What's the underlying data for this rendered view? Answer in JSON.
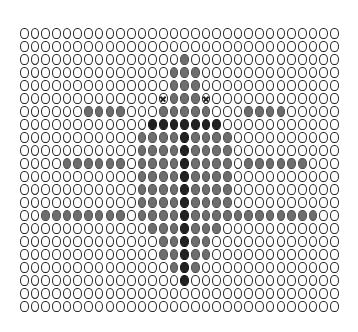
{
  "grid": {
    "columns": 30,
    "rows": 22,
    "empty_glyph": "O",
    "colors": {
      "outline": "#222222",
      "gray_fill": "#6e6e6e",
      "dark_fill": "#222222",
      "background": "#ffffff"
    },
    "legend_states": [
      "empty",
      "gray",
      "dark",
      "cross"
    ],
    "filled_cells": {
      "2": {
        "gray": [
          15
        ]
      },
      "3": {
        "gray": [
          14,
          15,
          16
        ]
      },
      "4": {
        "gray": [
          14,
          15,
          16
        ]
      },
      "5": {
        "gray": [
          14,
          15,
          16
        ],
        "cross": [
          13,
          17
        ]
      },
      "6": {
        "gray": [
          6,
          7,
          8,
          9,
          13,
          14,
          15,
          16,
          17,
          21,
          22,
          23,
          24
        ]
      },
      "7": {
        "dark": [
          12,
          13,
          14,
          15,
          16,
          17,
          18
        ]
      },
      "8": {
        "gray": [
          11,
          12,
          13,
          14,
          16,
          17,
          18,
          19
        ],
        "dark": [
          15
        ]
      },
      "9": {
        "gray": [
          11,
          12,
          13,
          14,
          16,
          17,
          18,
          19
        ],
        "dark": [
          15
        ]
      },
      "10": {
        "gray": [
          4,
          5,
          6,
          7,
          8,
          9,
          11,
          12,
          13,
          14,
          16,
          17,
          18,
          19,
          21,
          22,
          23,
          24,
          25,
          26
        ],
        "dark": [
          15
        ]
      },
      "11": {
        "gray": [
          11,
          12,
          13,
          14,
          16,
          17,
          18,
          19
        ],
        "dark": [
          15
        ]
      },
      "12": {
        "gray": [
          11,
          12,
          13,
          14,
          16,
          17,
          18,
          19
        ],
        "dark": [
          15
        ]
      },
      "13": {
        "gray": [
          11,
          12,
          13,
          14,
          16,
          17,
          18,
          19
        ],
        "dark": [
          15
        ]
      },
      "14": {
        "gray": [
          2,
          3,
          4,
          5,
          6,
          7,
          8,
          9,
          11,
          12,
          13,
          14,
          16,
          17,
          18,
          19,
          20,
          21,
          22,
          23,
          24,
          25,
          26,
          27
        ],
        "dark": [
          15
        ]
      },
      "15": {
        "gray": [
          12,
          13,
          14,
          16,
          17,
          18
        ],
        "dark": [
          15
        ]
      },
      "16": {
        "gray": [
          13,
          14,
          16,
          17
        ],
        "dark": [
          15
        ]
      },
      "17": {
        "gray": [
          13,
          14,
          16,
          17
        ],
        "dark": [
          15
        ]
      },
      "18": {
        "gray": [
          14,
          16
        ],
        "dark": [
          15
        ]
      },
      "19": {
        "dark": [
          15
        ]
      }
    }
  }
}
